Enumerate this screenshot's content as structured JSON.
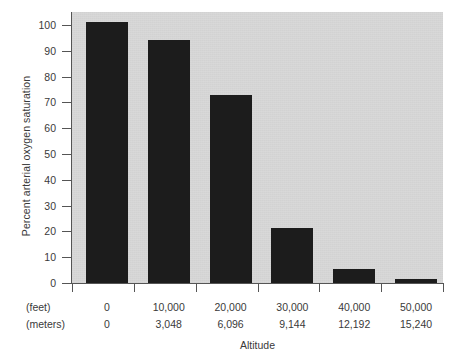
{
  "chart_data": {
    "type": "bar",
    "title": "",
    "xlabel": "Altitude",
    "ylabel": "Percent arterial oxygen saturation",
    "ylim": [
      0,
      105
    ],
    "yticks": [
      0,
      10,
      20,
      30,
      40,
      50,
      60,
      70,
      80,
      90,
      100
    ],
    "grid": false,
    "legend": null,
    "categories": [
      "0",
      "10,000",
      "20,000",
      "30,000",
      "40,000",
      "50,000"
    ],
    "values": [
      101,
      94,
      73,
      21.5,
      5.5,
      1.5
    ],
    "axis_rows": [
      {
        "name": "(feet)",
        "ticks": [
          "0",
          "10,000",
          "20,000",
          "30,000",
          "40,000",
          "50,000"
        ]
      },
      {
        "name": "(meters)",
        "ticks": [
          "0",
          "3,048",
          "6,096",
          "9,144",
          "12,192",
          "15,240"
        ]
      }
    ],
    "colors": {
      "bar": "#1c1c1c",
      "plot_background": "#d8d8d8",
      "page_background": "#ffffff",
      "axis": "#555555",
      "text": "#3a3a3a"
    }
  }
}
